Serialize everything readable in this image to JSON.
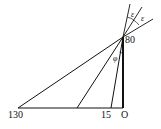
{
  "diagram": {
    "type": "geometry-diagram",
    "stroke_color": "#111111",
    "background": "#ffffff",
    "points": {
      "apex": {
        "label": "80",
        "x": 123,
        "y": 37
      },
      "origin": {
        "label": "O",
        "x": 123,
        "y": 108
      },
      "far": {
        "label": "130",
        "x": 18,
        "y": 108
      },
      "mid": {
        "label": "",
        "x": 77,
        "y": 108
      },
      "near": {
        "label": "15",
        "x": 111,
        "y": 108
      }
    },
    "labels": {
      "apex": "80",
      "origin": "O",
      "far": "130",
      "near": "15",
      "angle_phi": "φ",
      "angle_eps_1": "ε",
      "angle_eps_2": "ε"
    }
  }
}
